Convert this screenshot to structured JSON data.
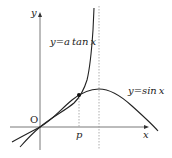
{
  "diagram": {
    "type": "function-graph",
    "axes": {
      "x_label": "x",
      "y_label": "y",
      "origin_label": "O"
    },
    "curves": [
      {
        "name": "tan-curve",
        "label": "y=atanx",
        "label_display": "y=a tan x"
      },
      {
        "name": "sin-curve",
        "label": "y=sinx",
        "label_display": "y=sin x"
      }
    ],
    "marks": {
      "intersection_x_label": "p",
      "asymptote": "dashed vertical line at x = π/2"
    },
    "labels": {
      "tan_label": "y=a tan x",
      "sin_label": "y=sin x",
      "x_axis": "x",
      "y_axis": "y",
      "origin": "O",
      "p": "p"
    },
    "colors": {
      "stroke": "#222222",
      "dashed": "#9a9a9a",
      "background": "#ffffff"
    }
  }
}
